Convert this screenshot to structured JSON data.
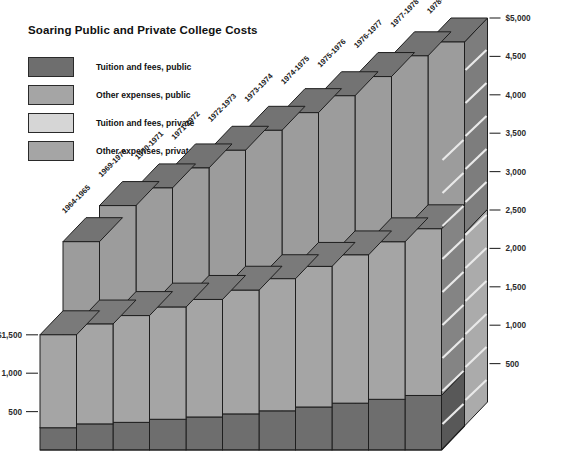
{
  "chart_data": {
    "type": "bar",
    "title": "Soaring Public and Private College Costs",
    "subtype": "3d-stacked-bar-two-row",
    "xlabel": "",
    "ylabel": "",
    "grid": false,
    "legend_position": "top-left",
    "ylim": [
      0,
      5000
    ],
    "y_axis_left_ticks": [
      "$1,500",
      "1,000",
      "500"
    ],
    "y_axis_left_values": [
      1500,
      1000,
      500
    ],
    "y_axis_right_ticks": [
      "$5,000",
      "4,500",
      "4,000",
      "3,500",
      "3,000",
      "2,500",
      "2,000",
      "1,500",
      "1,000",
      "500"
    ],
    "y_axis_right_values": [
      5000,
      4500,
      4000,
      3500,
      3000,
      2500,
      2000,
      1500,
      1000,
      500
    ],
    "categories": [
      "1964-1965",
      "1969-1970",
      "1970-1971",
      "1971-1972",
      "1972-1973",
      "1973-1974",
      "1974-1975",
      "1975-1976",
      "1976-1977",
      "1977-1978",
      "1978-1979"
    ],
    "legend": [
      {
        "label": "Tuition and fees, public",
        "color": "#6e6e6e"
      },
      {
        "label": "Other expenses, public",
        "color": "#a5a5a5"
      },
      {
        "label": "Tuition and fees, private",
        "color": "#d6d6d6"
      },
      {
        "label": "Other expenses, private",
        "color": "#a5a5a5"
      }
    ],
    "series": [
      {
        "name": "Tuition and fees, public",
        "row": "front",
        "color": "#6e6e6e",
        "values": [
          290,
          340,
          360,
          400,
          430,
          470,
          510,
          560,
          610,
          660,
          710
        ]
      },
      {
        "name": "Other expenses, public",
        "row": "front",
        "color": "#a5a5a5",
        "values": [
          1210,
          1300,
          1390,
          1460,
          1530,
          1610,
          1720,
          1830,
          1930,
          2050,
          2170
        ]
      },
      {
        "name": "Tuition and fees, private",
        "row": "back",
        "color": "#d6d6d6",
        "values": [
          1130,
          1400,
          1530,
          1670,
          1790,
          1940,
          2060,
          2170,
          2290,
          2410,
          2510
        ]
      },
      {
        "name": "Other expenses, private",
        "row": "back",
        "color": "#a5a5a5",
        "values": [
          1270,
          1470,
          1570,
          1690,
          1800,
          1910,
          2020,
          2130,
          2260,
          2410,
          2490
        ]
      }
    ],
    "totals_front": [
      1500,
      1640,
      1750,
      1860,
      1960,
      2080,
      2230,
      2390,
      2540,
      2710,
      2880
    ],
    "totals_back": [
      2400,
      2870,
      3100,
      3360,
      3590,
      3850,
      4080,
      4300,
      4550,
      4820,
      5000
    ]
  },
  "colors": {
    "tuition_public": "#6e6e6e",
    "other_public": "#a5a5a5",
    "tuition_private": "#d6d6d6",
    "other_private": "#a5a5a5",
    "top_dark": "#5d5d5d",
    "side_dark": "#5a5a5a",
    "outline": "#1e1e1e",
    "background": "#ffffff"
  }
}
